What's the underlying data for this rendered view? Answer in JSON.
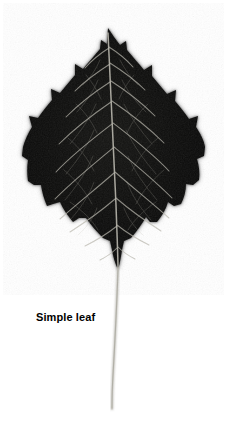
{
  "figure": {
    "caption": "Simple leaf",
    "background_color": "#ffffff",
    "width": 234,
    "height": 426
  },
  "specimen": {
    "name": "leaf-photograph",
    "subject": "simple leaf",
    "blade_color": "#0a0a0a",
    "blade_edge_color": "#9a9a9a",
    "vein_color": "#b9b7ad",
    "petiole_color": "#b0aea6",
    "margin_type": "crenate-serrate",
    "venation": "pinnate",
    "blade": {
      "apex_x": 108,
      "apex_y": 28,
      "base_x": 118,
      "base_y": 270,
      "left_extent": 22,
      "right_extent": 206,
      "widest_y": 168
    },
    "petiole": {
      "top_x": 118,
      "top_y": 270,
      "bottom_x": 112,
      "bottom_y": 410
    }
  }
}
